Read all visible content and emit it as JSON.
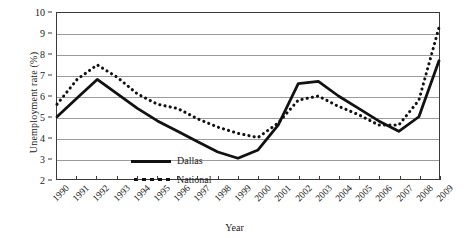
{
  "chart_data": {
    "type": "line",
    "title": "",
    "xlabel": "Year",
    "ylabel": "Unemployment rate (%)",
    "categories": [
      "1990",
      "1991",
      "1992",
      "1993",
      "1994",
      "1995",
      "1996",
      "1997",
      "1998",
      "1999",
      "2000",
      "2001",
      "2002",
      "2003",
      "2004",
      "2005",
      "2006",
      "2007",
      "2008",
      "2009"
    ],
    "xlim": [
      1990,
      2009
    ],
    "ylim": [
      2,
      10
    ],
    "yticks": [
      2,
      3,
      4,
      5,
      6,
      7,
      8,
      9,
      10
    ],
    "grid": true,
    "legend_position": "inside-lower-left",
    "series": [
      {
        "name": "Dallas",
        "style": "solid",
        "color": "#111111",
        "values": [
          5.0,
          5.9,
          6.8,
          6.1,
          5.4,
          4.8,
          4.3,
          3.8,
          3.3,
          3.0,
          3.4,
          4.6,
          6.6,
          6.7,
          6.0,
          5.4,
          4.8,
          4.3,
          5.0,
          7.7
        ]
      },
      {
        "name": "National",
        "style": "dotted",
        "color": "#111111",
        "values": [
          5.6,
          6.8,
          7.5,
          6.9,
          6.1,
          5.6,
          5.4,
          4.9,
          4.5,
          4.2,
          4.0,
          4.7,
          5.8,
          6.0,
          5.5,
          5.1,
          4.6,
          4.6,
          5.8,
          9.3
        ]
      }
    ]
  },
  "legend": {
    "items": [
      {
        "label": "Dallas"
      },
      {
        "label": "National"
      }
    ]
  }
}
